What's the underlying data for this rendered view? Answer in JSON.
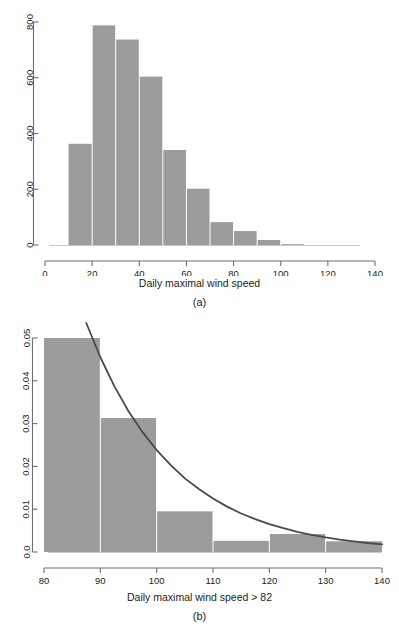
{
  "figure": {
    "panels": [
      {
        "id": "a",
        "caption": "(a)",
        "xlabel": "Daily maximal wind speed"
      },
      {
        "id": "b",
        "caption": "(b)",
        "xlabel": "Daily maximal wind speed > 82"
      }
    ]
  },
  "chart_data": [
    {
      "type": "bar",
      "title": "",
      "subtitle": "",
      "panel": "(a)",
      "xlabel": "Daily maximal wind speed",
      "ylabel": "",
      "xlim": [
        0,
        140
      ],
      "ylim": [
        0,
        800
      ],
      "xticks": [
        0,
        20,
        40,
        60,
        80,
        100,
        120,
        140
      ],
      "xticklabels": [
        "0",
        "20",
        "40",
        "60",
        "80",
        "100",
        "120",
        "140"
      ],
      "yticks": [
        0,
        200,
        400,
        600,
        800
      ],
      "yticklabels": [
        "0",
        "200",
        "400",
        "600",
        "800"
      ],
      "grid": false,
      "legend": null,
      "binwidth": 10,
      "bin_edges": [
        10,
        20,
        30,
        40,
        50,
        60,
        70,
        80,
        90,
        100,
        110
      ],
      "categories": [
        "10-20",
        "20-30",
        "30-40",
        "40-50",
        "50-60",
        "60-70",
        "70-80",
        "80-90",
        "90-100",
        "100-110"
      ],
      "values": [
        363,
        788,
        737,
        604,
        341,
        202,
        82,
        50,
        18,
        3
      ],
      "bar_color": "#9c9c9c",
      "annotations": []
    },
    {
      "type": "bar",
      "title": "",
      "subtitle": "",
      "panel": "(b)",
      "xlabel": "Daily maximal wind speed > 82",
      "ylabel": "",
      "xlim": [
        80,
        140
      ],
      "ylim": [
        0,
        0.05
      ],
      "xticks": [
        80,
        90,
        100,
        110,
        120,
        130,
        140
      ],
      "xticklabels": [
        "80",
        "90",
        "100",
        "110",
        "120",
        "130",
        "140"
      ],
      "yticks": [
        0.0,
        0.01,
        0.02,
        0.03,
        0.04,
        0.05
      ],
      "yticklabels": [
        "0.0",
        "0.01",
        "0.02",
        "0.03",
        "0.04",
        "0.05"
      ],
      "grid": false,
      "legend": null,
      "binwidth": 10,
      "bin_edges": [
        80,
        90,
        100,
        110,
        120,
        130,
        140
      ],
      "categories": [
        "80-90",
        "90-100",
        "100-110",
        "110-120",
        "120-130",
        "130-140"
      ],
      "values": [
        0.05,
        0.0313,
        0.0095,
        0.0026,
        0.0042,
        0.0025
      ],
      "bar_color": "#9c9c9c",
      "overlay_series": {
        "name": "fitted exponential density",
        "type": "line",
        "color": "#4a4a4a",
        "x": [
          87.5,
          90,
          92.5,
          95,
          97.5,
          100,
          102.5,
          105,
          107.5,
          110,
          112.5,
          115,
          117.5,
          120,
          122.5,
          125,
          127.5,
          130,
          132.5,
          135,
          137.5,
          140
        ],
        "y": [
          0.0535,
          0.0455,
          0.0387,
          0.0329,
          0.028,
          0.0238,
          0.0203,
          0.0172,
          0.0147,
          0.0125,
          0.0106,
          0.009,
          0.0077,
          0.0065,
          0.0056,
          0.0047,
          0.004,
          0.0034,
          0.0029,
          0.0025,
          0.0021,
          0.0018
        ]
      },
      "annotations": []
    }
  ]
}
